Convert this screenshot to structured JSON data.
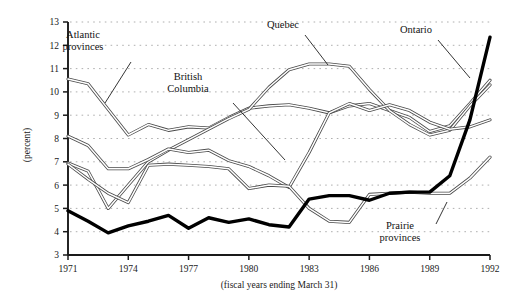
{
  "chart_data": {
    "type": "line",
    "title": "",
    "xlabel": "(fiscal years ending March 31)",
    "ylabel": "(percent)",
    "xlim": [
      1971,
      1992
    ],
    "ylim": [
      3,
      13
    ],
    "ytick_step": 1,
    "grid": true,
    "grid_style": "dotted-horizontal",
    "legend": "inline-annotations",
    "xticks": [
      "1971",
      "1974",
      "1977",
      "1980",
      "1983",
      "1986",
      "1989",
      "1992"
    ],
    "yticks": [
      "3",
      "4",
      "5",
      "6",
      "7",
      "8",
      "9",
      "10",
      "11",
      "12",
      "13"
    ],
    "x": [
      1971,
      1972,
      1973,
      1974,
      1975,
      1976,
      1977,
      1978,
      1979,
      1980,
      1981,
      1982,
      1983,
      1984,
      1985,
      1986,
      1987,
      1988,
      1989,
      1990,
      1991,
      1992
    ],
    "series": [
      {
        "name": "Atlantic provinces",
        "style": "double-band",
        "values": [
          10.55,
          10.35,
          9.25,
          8.15,
          8.6,
          8.35,
          8.5,
          8.45,
          8.9,
          9.3,
          9.4,
          9.45,
          9.3,
          9.1,
          9.4,
          9.5,
          9.2,
          8.9,
          8.3,
          8.55,
          9.5,
          10.5
        ]
      },
      {
        "name": "Quebec",
        "style": "double-band",
        "values": [
          6.95,
          6.6,
          5.0,
          6.0,
          7.0,
          7.5,
          7.95,
          8.4,
          8.85,
          9.25,
          10.2,
          10.95,
          11.2,
          11.2,
          11.1,
          10.1,
          9.2,
          8.6,
          8.15,
          8.35,
          9.4,
          10.3
        ]
      },
      {
        "name": "British Columbia",
        "style": "double-band",
        "values": [
          8.1,
          7.7,
          6.7,
          6.7,
          7.1,
          7.55,
          7.4,
          7.5,
          7.05,
          6.8,
          6.4,
          5.9,
          7.4,
          9.1,
          9.5,
          9.2,
          9.45,
          9.2,
          8.7,
          8.4,
          8.5,
          8.8
        ]
      },
      {
        "name": "Prairie provinces",
        "style": "double-band",
        "values": [
          6.9,
          6.25,
          5.65,
          5.25,
          6.85,
          6.9,
          6.85,
          6.8,
          6.7,
          5.85,
          6.0,
          5.95,
          5.0,
          4.45,
          4.4,
          5.6,
          5.65,
          5.7,
          5.65,
          5.65,
          6.3,
          7.2
        ]
      },
      {
        "name": "Ontario",
        "style": "bold-solid",
        "values": [
          4.9,
          4.45,
          3.95,
          4.25,
          4.45,
          4.7,
          4.15,
          4.6,
          4.4,
          4.55,
          4.3,
          4.2,
          5.4,
          5.55,
          5.55,
          5.35,
          5.65,
          5.7,
          5.7,
          6.4,
          8.8,
          12.35
        ]
      }
    ],
    "annotations": [
      {
        "name": "Atlantic provinces",
        "text_line1": "Atlantic",
        "text_line2": "provinces",
        "tx": 83,
        "ty": 38,
        "leader": [
          [
            131,
            62
          ],
          [
            105,
            103
          ]
        ]
      },
      {
        "name": "British Columbia",
        "text_line1": "British",
        "text_line2": "Columbia",
        "tx": 188,
        "ty": 80,
        "leader": [
          [
            233,
            103
          ],
          [
            285,
            160
          ]
        ]
      },
      {
        "name": "Quebec",
        "text_line1": "Quebec",
        "text_line2": "",
        "tx": 283,
        "ty": 28,
        "leader": [
          [
            305,
            35
          ],
          [
            328,
            65
          ]
        ]
      },
      {
        "name": "Ontario",
        "text_line1": "Ontario",
        "text_line2": "",
        "tx": 416,
        "ty": 33,
        "leader": [
          [
            438,
            40
          ],
          [
            470,
            78
          ]
        ]
      },
      {
        "name": "Prairie provinces",
        "text_line1": "Prairie",
        "text_line2": "provinces",
        "tx": 400,
        "ty": 229,
        "leader": [
          [
            436,
            224
          ],
          [
            447,
            202
          ]
        ]
      }
    ]
  },
  "axis": {
    "ylabel_text": "(percent)",
    "xlabel_text": "(fiscal years ending March 31)"
  }
}
